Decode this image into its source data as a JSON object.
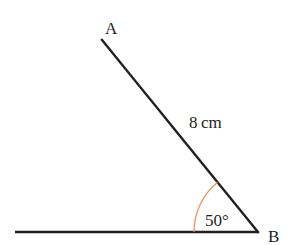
{
  "diagram": {
    "points": {
      "A": {
        "label": "A",
        "x": 102,
        "y": 40
      },
      "B": {
        "label": "B",
        "x": 258,
        "y": 232
      },
      "C": {
        "x": 15,
        "y": 232
      }
    },
    "segments": [
      {
        "from": "A",
        "to": "B",
        "label": "8 cm"
      },
      {
        "from": "C",
        "to": "B"
      }
    ],
    "angle": {
      "vertex": "B",
      "label": "50°",
      "arc_color": "#e8955a",
      "radius": 64
    },
    "line_color": "#231f20"
  }
}
